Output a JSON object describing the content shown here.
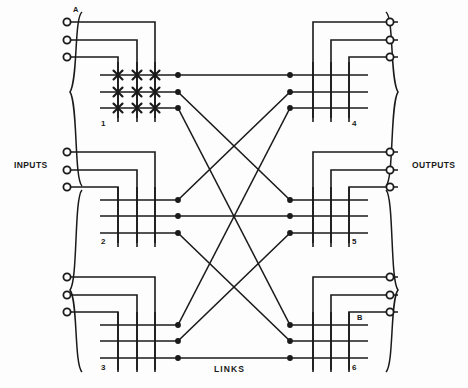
{
  "diagram": {
    "labels": {
      "inputs": "INPUTS",
      "outputs": "OUTPUTS",
      "links": "LINKS",
      "point_a": "A",
      "point_b": "B"
    },
    "colors": {
      "line": "#1a1a1a",
      "background": "#fdfdfd",
      "terminal_fill": "#ffffff",
      "text": "#1a1a1a"
    },
    "input_matrices": [
      {
        "id": "1",
        "label": "1",
        "crosspoints": true,
        "rows": 3,
        "cols": 3
      },
      {
        "id": "2",
        "label": "2",
        "crosspoints": false,
        "rows": 3,
        "cols": 3
      },
      {
        "id": "3",
        "label": "3",
        "crosspoints": false,
        "rows": 3,
        "cols": 3
      }
    ],
    "output_matrices": [
      {
        "id": "4",
        "label": "4",
        "crosspoints": false,
        "rows": 3,
        "cols": 3
      },
      {
        "id": "5",
        "label": "5",
        "crosspoints": false,
        "rows": 3,
        "cols": 3
      },
      {
        "id": "6",
        "label": "6",
        "crosspoints": false,
        "rows": 3,
        "cols": 3
      }
    ],
    "input_terminals": 9,
    "output_terminals": 9,
    "links": [
      {
        "from": "1",
        "to": "4",
        "from_row": 1,
        "to_row": 1
      },
      {
        "from": "1",
        "to": "5",
        "from_row": 2,
        "to_row": 1
      },
      {
        "from": "1",
        "to": "6",
        "from_row": 3,
        "to_row": 1
      },
      {
        "from": "2",
        "to": "4",
        "from_row": 1,
        "to_row": 2
      },
      {
        "from": "2",
        "to": "5",
        "from_row": 2,
        "to_row": 2
      },
      {
        "from": "2",
        "to": "6",
        "from_row": 3,
        "to_row": 2
      },
      {
        "from": "3",
        "to": "4",
        "from_row": 1,
        "to_row": 3
      },
      {
        "from": "3",
        "to": "5",
        "from_row": 2,
        "to_row": 3
      },
      {
        "from": "3",
        "to": "6",
        "from_row": 3,
        "to_row": 3
      }
    ]
  }
}
